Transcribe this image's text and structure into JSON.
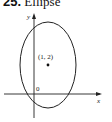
{
  "figure": {
    "number": "25.",
    "title": "Ellipse",
    "axes": {
      "x_label": "x",
      "y_label": "y",
      "origin_label": "0"
    },
    "center_point": {
      "label": "(1, 2)",
      "x": 1,
      "y": 2
    },
    "colors": {
      "stroke": "#222222",
      "background": "#ffffff"
    }
  }
}
